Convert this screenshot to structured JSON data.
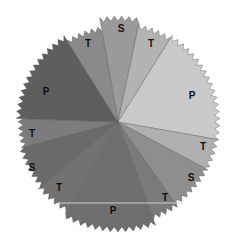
{
  "figure": {
    "center": [
      118,
      122
    ],
    "sectors": [
      {
        "label": "S",
        "start": -100,
        "end": -78,
        "r": 104,
        "color": "#9a9a9a",
        "label_pos": [
          121,
          29
        ]
      },
      {
        "label": "T",
        "start": -78,
        "end": -58,
        "r": 98,
        "color": "#b3b3b3",
        "label_pos": [
          151,
          44
        ]
      },
      {
        "label": "P",
        "start": -58,
        "end": 10,
        "r": 100,
        "color": "#c9c9c9",
        "label_pos": [
          192,
          96
        ]
      },
      {
        "label": "T",
        "start": 10,
        "end": 28,
        "r": 100,
        "color": "#b0b0b0",
        "label_pos": [
          203,
          147
        ]
      },
      {
        "label": "S",
        "start": 28,
        "end": 55,
        "r": 100,
        "color": "#8e8e8e",
        "label_pos": [
          191,
          178
        ]
      },
      {
        "label": "T",
        "start": 55,
        "end": 70,
        "r": 102,
        "color": "#7a7a7a",
        "label_pos": [
          165,
          198
        ]
      },
      {
        "label": "P",
        "start": 70,
        "end": 120,
        "r": 108,
        "color": "#6e6e6e",
        "label_pos": [
          113,
          211
        ]
      },
      {
        "label": "T",
        "start": 120,
        "end": 140,
        "r": 102,
        "color": "#727272",
        "label_pos": [
          59,
          188
        ]
      },
      {
        "label": "S",
        "start": 140,
        "end": 165,
        "r": 100,
        "color": "#6a6a6a",
        "label_pos": [
          32,
          168
        ]
      },
      {
        "label": "T",
        "start": 165,
        "end": 182,
        "r": 98,
        "color": "#7c7c7c",
        "label_pos": [
          32,
          134
        ]
      },
      {
        "label": "P",
        "start": 182,
        "end": 238,
        "r": 100,
        "color": "#5e5e5e",
        "label_pos": [
          46,
          92
        ]
      },
      {
        "label": "T",
        "start": 238,
        "end": 260,
        "r": 95,
        "color": "#8a8a8a",
        "label_pos": [
          88,
          44
        ]
      }
    ]
  }
}
